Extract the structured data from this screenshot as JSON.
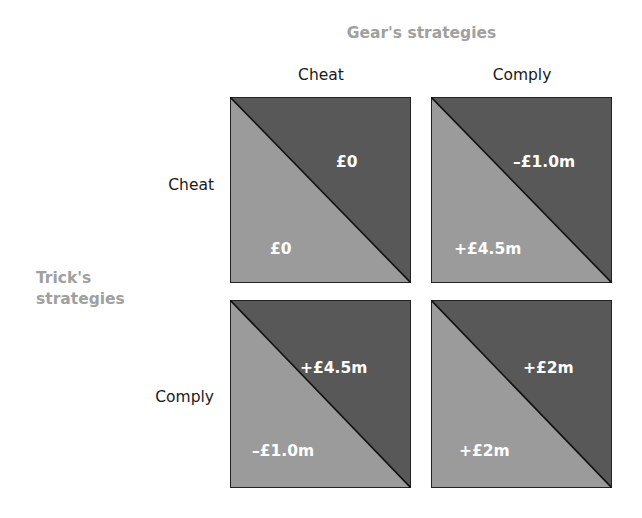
{
  "title_columns": "Gear's strategies",
  "title_rows": "Trick's strategies",
  "columns": [
    "Cheat",
    "Comply"
  ],
  "rows": [
    "Cheat",
    "Comply"
  ],
  "colors": {
    "upper_triangle": "#585858",
    "lower_triangle": "#9b9b9b",
    "diagonal": "#111111",
    "title": "#a0a0a0"
  },
  "cells": [
    {
      "row": "Cheat",
      "col": "Cheat",
      "gear_payoff": "£0",
      "trick_payoff": "£0"
    },
    {
      "row": "Cheat",
      "col": "Comply",
      "gear_payoff": "–£1.0m",
      "trick_payoff": "+£4.5m"
    },
    {
      "row": "Comply",
      "col": "Cheat",
      "gear_payoff": "+£4.5m",
      "trick_payoff": "–£1.0m"
    },
    {
      "row": "Comply",
      "col": "Comply",
      "gear_payoff": "+£2m",
      "trick_payoff": "+£2m"
    }
  ]
}
